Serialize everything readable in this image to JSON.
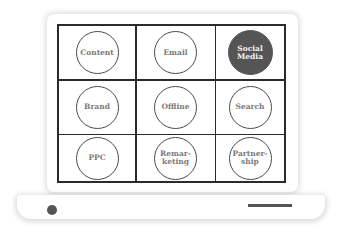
{
  "diagram": {
    "type": "laptop-grid",
    "grid": {
      "rows": 3,
      "cols": 3,
      "cells": [
        {
          "label": "Content",
          "highlighted": false
        },
        {
          "label": "Email",
          "highlighted": false
        },
        {
          "label": "Social\nMedia",
          "highlighted": true
        },
        {
          "label": "Brand",
          "highlighted": false
        },
        {
          "label": "Offline",
          "highlighted": false
        },
        {
          "label": "Search",
          "highlighted": false
        },
        {
          "label": "PPC",
          "highlighted": false
        },
        {
          "label": "Remar-\nketing",
          "highlighted": false
        },
        {
          "label": "Partner-\nship",
          "highlighted": false
        }
      ]
    },
    "colors": {
      "grid_line": "#2b2b2b",
      "circle_outline": "#4a4a4a",
      "label_text": "#7a7a7a",
      "highlight_fill": "#555555",
      "highlight_text": "#f2f2f2"
    }
  }
}
